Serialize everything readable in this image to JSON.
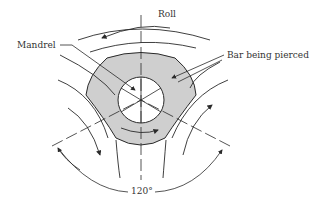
{
  "diagram": {
    "labels": {
      "roll": "Roll",
      "mandrel": "Mandrel",
      "bar": "Bar being pierced",
      "angle": "120°"
    },
    "colors": {
      "stroke": "#2a2a2a",
      "bar_fill": "#cfcfcf",
      "mandrel_fill": "#ffffff",
      "background": "#ffffff"
    },
    "geometry": {
      "center": [
        141,
        100
      ],
      "mandrel_radius": 23,
      "roll_count": 3,
      "roll_spacing_deg": 120
    }
  }
}
